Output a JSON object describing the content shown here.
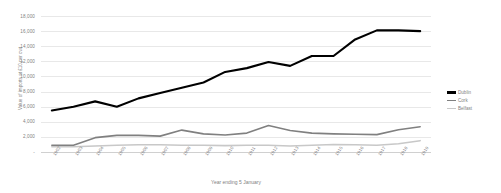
{
  "chart_data": {
    "type": "line",
    "title": "",
    "xlabel": "Year ending 5 January",
    "ylabel": "Value of imports at £10 per cwt",
    "ylim": [
      0,
      18000
    ],
    "ytick_step": 2000,
    "grid": true,
    "legend_position": "right",
    "yticks": [
      "18,000",
      "16,000",
      "14,000",
      "12,000",
      "10,000",
      "8,000",
      "6,000",
      "4,000",
      "2,000",
      "-"
    ],
    "categories": [
      "1902",
      "1903",
      "1904",
      "1905",
      "1906",
      "1907",
      "1908",
      "1909",
      "1910",
      "1911",
      "1912",
      "1913",
      "1914",
      "1915",
      "1916",
      "1917",
      "1918",
      "1919"
    ],
    "series": [
      {
        "name": "Dublin",
        "color": "#000000",
        "values": [
          5500,
          6000,
          6700,
          6000,
          7100,
          7800,
          8500,
          9200,
          10600,
          11100,
          11900,
          11400,
          12700,
          12700,
          14900,
          16100,
          16100,
          16000
        ]
      },
      {
        "name": "Cork",
        "color": "#808080",
        "values": [
          900,
          900,
          1900,
          2200,
          2200,
          2100,
          2900,
          2400,
          2250,
          2500,
          3500,
          2850,
          2500,
          2400,
          2350,
          2300,
          2950,
          3350
        ]
      },
      {
        "name": "Belfast",
        "color": "#c8c8c8",
        "values": [
          700,
          700,
          800,
          900,
          950,
          950,
          900,
          900,
          850,
          900,
          900,
          800,
          900,
          1000,
          950,
          900,
          1100,
          1500
        ]
      }
    ]
  },
  "legend": {
    "items": [
      {
        "label": "Dublin"
      },
      {
        "label": "Cork"
      },
      {
        "label": "Belfast"
      }
    ]
  },
  "axes": {
    "x_title": "Year ending 5 January",
    "y_title": "Value of imports at £10 per cwt"
  }
}
